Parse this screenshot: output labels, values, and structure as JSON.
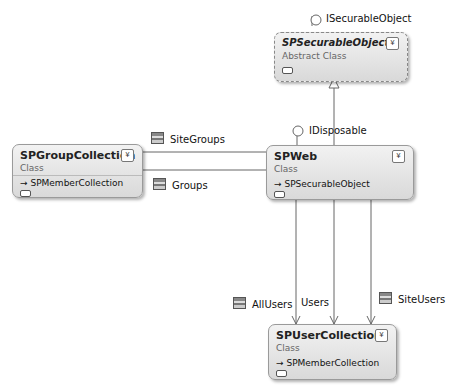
{
  "interfaces": {
    "isecurable": "ISecurableObject",
    "idisposable": "IDisposable"
  },
  "classes": {
    "securable": {
      "name": "SPSecurableObject",
      "stereotype": "Abstract Class",
      "base": ""
    },
    "group": {
      "name": "SPGroupCollection",
      "stereotype": "Class",
      "base": "SPMemberCollection"
    },
    "web": {
      "name": "SPWeb",
      "stereotype": "Class",
      "base": "SPSecurableObject"
    },
    "user": {
      "name": "SPUserCollection",
      "stereotype": "Class",
      "base": "SPMemberCollection"
    }
  },
  "associations": {
    "sitegroups": "SiteGroups",
    "groups": "Groups",
    "allusers": "AllUsers",
    "users": "Users",
    "siteusers": "SiteUsers"
  },
  "icons": {
    "expand": "double-chevron-down-icon",
    "property": "property-icon",
    "inherit": "arrow-right-icon",
    "lollipop": "interface-lollipop-icon"
  },
  "glyphs": {
    "expand": "¥",
    "inherit": "→"
  }
}
